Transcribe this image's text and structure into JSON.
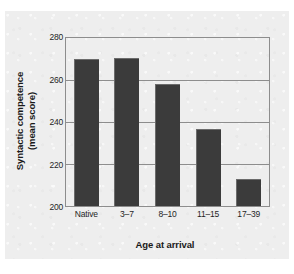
{
  "chart_data": {
    "type": "bar",
    "title": "",
    "categories": [
      "Native",
      "3–17",
      "8–10",
      "11–15",
      "17–39"
    ],
    "values": [
      270,
      270.5,
      258,
      236.5,
      213
    ],
    "xlabel": "Age at arrival",
    "ylabel_lines": [
      "Syntactic competence",
      "(mean score)"
    ],
    "ylabel": "Syntactic competence (mean score)",
    "ylim": [
      200,
      280
    ],
    "yticks": [
      200,
      220,
      240,
      260,
      280
    ],
    "ytick_labels": [
      "200",
      "220",
      "240",
      "260",
      "280"
    ],
    "grid": true,
    "legend": null,
    "series_color": "#3b3b3b",
    "axis_color": "#8d8d8d",
    "background_color": "#eeeeee"
  },
  "figure": {
    "xlabel": "Age at arrival",
    "ylabel_line1": "Syntactic competence",
    "ylabel_line2": "(mean score)",
    "ytick_0": "200",
    "ytick_1": "220",
    "ytick_2": "240",
    "ytick_3": "260",
    "ytick_4": "280",
    "xtick_0": "Native",
    "xtick_1": "3–7",
    "xtick_2": "8–10",
    "xtick_3": "11–15",
    "xtick_4": "17–39"
  }
}
